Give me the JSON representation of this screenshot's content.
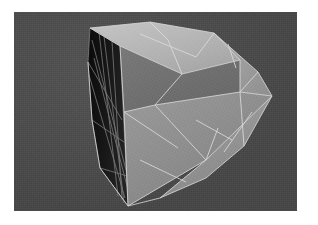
{
  "page": {
    "background_color": "#ffffff",
    "width": 318,
    "height": 225
  },
  "viewport": {
    "name": "3d-render-viewport",
    "background_color": "#4a4a4a",
    "x": 14,
    "y": 12,
    "width": 283,
    "height": 199
  },
  "model": {
    "name": "convex-polyhedron-mesh",
    "description": "Shaded convex polyhedron with white wireframe edges",
    "wireframe_color": "#d8d8d8",
    "shading": {
      "dark_face_color": "#151515",
      "dark_face_shadow_color": "#0c0c0c",
      "mid_face_color": "#6e6e6e",
      "light_face_color": "#a8a8a8",
      "bright_face_color": "#bdbdbd",
      "lower_face_color": "#8e8e8e",
      "right_wing_color": "#9b9b9b"
    },
    "silhouette": [
      [
        90,
        28
      ],
      [
        150,
        22
      ],
      [
        214,
        33
      ],
      [
        258,
        72
      ],
      [
        272,
        96
      ],
      [
        244,
        146
      ],
      [
        206,
        178
      ],
      [
        160,
        198
      ],
      [
        128,
        206
      ],
      [
        100,
        168
      ],
      [
        92,
        120
      ],
      [
        88,
        62
      ]
    ],
    "faces": [
      {
        "id": "face-left-dark",
        "tone": "dark",
        "points": [
          [
            90,
            28
          ],
          [
            120,
            46
          ],
          [
            128,
            206
          ],
          [
            100,
            168
          ],
          [
            92,
            120
          ],
          [
            88,
            62
          ]
        ]
      },
      {
        "id": "face-top-bright",
        "tone": "bright",
        "points": [
          [
            90,
            28
          ],
          [
            150,
            22
          ],
          [
            214,
            33
          ],
          [
            240,
            60
          ],
          [
            182,
            74
          ],
          [
            120,
            46
          ]
        ]
      },
      {
        "id": "face-top-right",
        "tone": "light",
        "points": [
          [
            214,
            33
          ],
          [
            258,
            72
          ],
          [
            272,
            96
          ],
          [
            240,
            92
          ],
          [
            240,
            60
          ]
        ]
      },
      {
        "id": "face-mid-upper",
        "tone": "mid",
        "points": [
          [
            120,
            46
          ],
          [
            182,
            74
          ],
          [
            240,
            60
          ],
          [
            240,
            92
          ],
          [
            155,
            105
          ],
          [
            124,
            112
          ]
        ]
      },
      {
        "id": "face-mid-lower",
        "tone": "lower",
        "points": [
          [
            124,
            112
          ],
          [
            155,
            105
          ],
          [
            240,
            92
          ],
          [
            272,
            96
          ],
          [
            206,
            160
          ],
          [
            128,
            206
          ]
        ]
      },
      {
        "id": "face-bottom-right",
        "tone": "right-wing",
        "points": [
          [
            206,
            160
          ],
          [
            272,
            96
          ],
          [
            244,
            146
          ],
          [
            206,
            178
          ],
          [
            160,
            198
          ]
        ]
      }
    ],
    "wireframe_edges": {
      "dark_face_count": 9,
      "light_face_count": 17
    }
  }
}
